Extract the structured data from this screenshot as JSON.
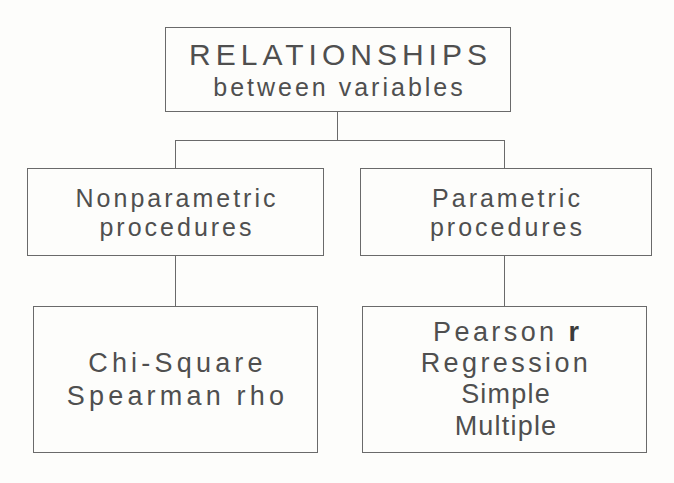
{
  "diagram": {
    "title": "RELATIONSHIPS between variables",
    "type": "hierarchy-tree",
    "orientation": "top-down",
    "line_color": "#6a6a6a",
    "text_color": "#4f4f4f",
    "background_color": "#fdfdfb",
    "root": {
      "line1": "RELATIONSHIPS",
      "line2": "between variables"
    },
    "branches": [
      {
        "heading": {
          "line1": "Nonparametric",
          "line2": "procedures"
        },
        "methods": [
          "Chi-Square",
          "Spearman rho"
        ]
      },
      {
        "heading": {
          "line1": "Parametric",
          "line2": "procedures"
        },
        "methods": [
          "Pearson ",
          "r",
          "Regression",
          "Simple",
          "Multiple"
        ]
      }
    ],
    "parametric_methods": {
      "pearson_label": "Pearson ",
      "pearson_symbol": "r",
      "regression": "Regression",
      "regression_sub1": "Simple",
      "regression_sub2": "Multiple"
    },
    "nonparametric_methods": {
      "chi_square": "Chi-Square",
      "spearman": "Spearman rho"
    }
  }
}
